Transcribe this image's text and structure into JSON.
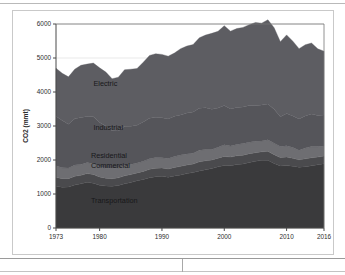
{
  "figure": {
    "background_color": "#ffffff",
    "frame_color": "#c9c9c9",
    "plot_background_color": "#ffffff"
  },
  "chart_data": {
    "type": "area",
    "stacked": true,
    "title": "",
    "subtitle": "",
    "xlabel": "",
    "ylabel": "CO2 (mmt)",
    "xlim": [
      1973,
      2016
    ],
    "ylim": [
      0,
      6000
    ],
    "grid": true,
    "grid_axis": "y",
    "grid_color": "#e3e3e3",
    "legend_position": "inline-annotations",
    "x_tick_labels": [
      "1973",
      "1980",
      "1990",
      "2000",
      "2010",
      "2016"
    ],
    "x_tick_values": [
      1973,
      1980,
      1990,
      2000,
      2010,
      2016
    ],
    "y_tick_labels": [
      "0",
      "1000",
      "2000",
      "3000",
      "4000",
      "5000",
      "6000"
    ],
    "y_tick_values": [
      0,
      1000,
      2000,
      3000,
      4000,
      5000,
      6000
    ],
    "x": [
      1973,
      1974,
      1975,
      1976,
      1977,
      1978,
      1979,
      1980,
      1981,
      1982,
      1983,
      1984,
      1985,
      1986,
      1987,
      1988,
      1989,
      1990,
      1991,
      1992,
      1993,
      1994,
      1995,
      1996,
      1997,
      1998,
      1999,
      2000,
      2001,
      2002,
      2003,
      2004,
      2005,
      2006,
      2007,
      2008,
      2009,
      2010,
      2011,
      2012,
      2013,
      2014,
      2015,
      2016
    ],
    "series": [
      {
        "name": "Transportation",
        "color": "#3a3a3c",
        "label_color": "#18181a",
        "values": [
          1230,
          1200,
          1205,
          1265,
          1300,
          1345,
          1315,
          1255,
          1235,
          1225,
          1250,
          1300,
          1335,
          1390,
          1430,
          1480,
          1510,
          1520,
          1490,
          1530,
          1560,
          1600,
          1630,
          1680,
          1710,
          1750,
          1800,
          1840,
          1830,
          1870,
          1880,
          1930,
          1960,
          1990,
          1995,
          1900,
          1825,
          1835,
          1815,
          1790,
          1805,
          1830,
          1860,
          1890
        ]
      },
      {
        "name": "Commercial",
        "color": "#4a4a4d",
        "label_color": "#18181a",
        "values": [
          260,
          250,
          245,
          255,
          250,
          255,
          255,
          245,
          230,
          225,
          225,
          235,
          235,
          230,
          235,
          245,
          250,
          245,
          245,
          250,
          255,
          255,
          250,
          265,
          265,
          250,
          255,
          265,
          255,
          255,
          260,
          255,
          255,
          250,
          260,
          255,
          245,
          250,
          235,
          215,
          230,
          235,
          225,
          225
        ]
      },
      {
        "name": "Residential",
        "color": "#6e6e72",
        "label_color": "#18181a",
        "values": [
          340,
          320,
          315,
          330,
          320,
          330,
          320,
          310,
          295,
          300,
          290,
          300,
          300,
          290,
          295,
          310,
          315,
          300,
          310,
          320,
          330,
          325,
          320,
          345,
          335,
          310,
          320,
          340,
          325,
          330,
          345,
          335,
          335,
          320,
          340,
          335,
          325,
          335,
          315,
          285,
          320,
          330,
          310,
          300
        ]
      },
      {
        "name": "Industrial",
        "color": "#55555a",
        "label_color": "#18181a",
        "values": [
          1455,
          1390,
          1285,
          1360,
          1380,
          1350,
          1380,
          1290,
          1240,
          1110,
          1090,
          1160,
          1120,
          1110,
          1160,
          1190,
          1180,
          1180,
          1160,
          1190,
          1180,
          1205,
          1215,
          1230,
          1225,
          1180,
          1155,
          1160,
          1090,
          1090,
          1075,
          1080,
          1045,
          1055,
          1050,
          1000,
          875,
          950,
          930,
          915,
          940,
          955,
          915,
          905
        ]
      },
      {
        "name": "Electric",
        "color": "#5d5d62",
        "label_color": "#18181a",
        "values": [
          1415,
          1390,
          1395,
          1460,
          1535,
          1540,
          1580,
          1610,
          1585,
          1530,
          1580,
          1660,
          1680,
          1670,
          1755,
          1850,
          1870,
          1860,
          1850,
          1855,
          1950,
          1965,
          1980,
          2075,
          2140,
          2235,
          2255,
          2345,
          2290,
          2320,
          2340,
          2380,
          2450,
          2410,
          2480,
          2400,
          2210,
          2310,
          2200,
          2070,
          2095,
          2090,
          1960,
          1880
        ]
      }
    ],
    "annotations": [
      {
        "text": "Electric",
        "x": 1979.0,
        "y": 4180
      },
      {
        "text": "Industrial",
        "x": 1979.0,
        "y": 2880
      },
      {
        "text": "Residential",
        "x": 1978.6,
        "y": 2055
      },
      {
        "text": "Commercial",
        "x": 1978.6,
        "y": 1760
      },
      {
        "text": "Transportation",
        "x": 1978.6,
        "y": 740
      }
    ]
  }
}
